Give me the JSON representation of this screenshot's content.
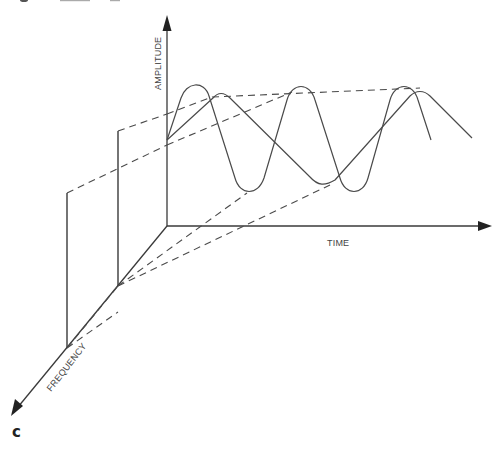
{
  "figure": {
    "panel_label": "c",
    "axes": {
      "amplitude": {
        "label": "AMPLITUDE"
      },
      "time": {
        "label": "TIME"
      },
      "frequency": {
        "label": "FREQUENCY"
      }
    },
    "components": [
      {
        "name": "high-frequency sine wave",
        "style": "solid"
      },
      {
        "name": "low-frequency sine wave",
        "style": "solid"
      },
      {
        "name": "projection lines",
        "style": "dashed"
      },
      {
        "name": "frequency spectrum stems",
        "count": 2,
        "style": "solid"
      }
    ],
    "colors": {
      "line": "#3a3a3a",
      "background": "#ffffff"
    }
  }
}
